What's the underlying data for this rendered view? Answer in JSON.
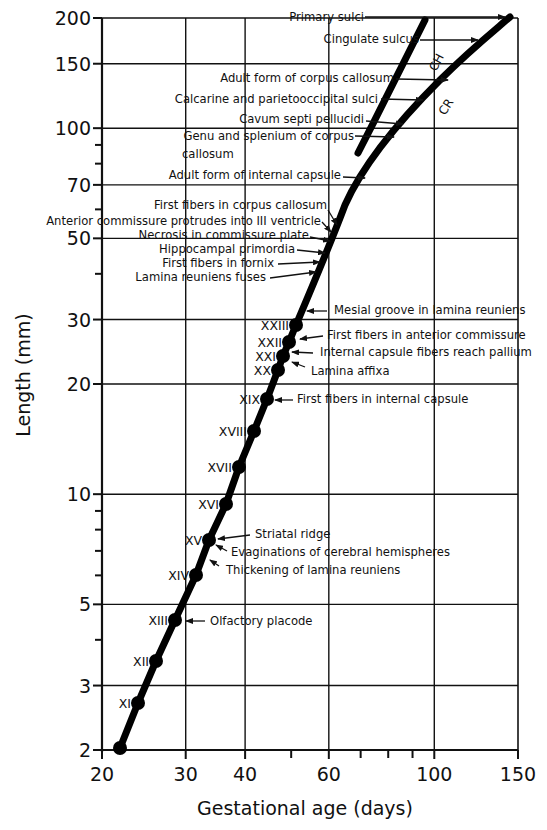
{
  "chart_data": {
    "type": "line",
    "title": "",
    "xlabel": "Gestational age (days)",
    "ylabel": "Length (mm)",
    "xscale": "log",
    "yscale": "log",
    "xlim": [
      20,
      150
    ],
    "ylim": [
      2,
      200
    ],
    "grid": true,
    "x_ticks": [
      20,
      30,
      40,
      60,
      100,
      150
    ],
    "y_ticks": [
      2,
      3,
      5,
      10,
      20,
      30,
      50,
      70,
      100,
      150,
      200
    ],
    "series": [
      {
        "name": "Carnegie stages (crown-rump length)",
        "points": [
          {
            "stage": "",
            "x": 22,
            "y": 2.0
          },
          {
            "stage": "XI",
            "x": 24,
            "y": 2.8
          },
          {
            "stage": "XII",
            "x": 26,
            "y": 3.5
          },
          {
            "stage": "XIII",
            "x": 28,
            "y": 4.5
          },
          {
            "stage": "XIV",
            "x": 31,
            "y": 6
          },
          {
            "stage": "XV",
            "x": 33,
            "y": 7.5
          },
          {
            "stage": "XVI",
            "x": 35,
            "y": 9.5
          },
          {
            "stage": "XVII",
            "x": 38,
            "y": 12
          },
          {
            "stage": "XVIII",
            "x": 41,
            "y": 15
          },
          {
            "stage": "XIX",
            "x": 44,
            "y": 18
          },
          {
            "stage": "XX",
            "x": 46,
            "y": 22
          },
          {
            "stage": "XXI",
            "x": 47,
            "y": 24.5
          },
          {
            "stage": "XXII",
            "x": 48.5,
            "y": 27
          },
          {
            "stage": "XXIII",
            "x": 50,
            "y": 29.5
          }
        ]
      },
      {
        "name": "CR",
        "points": [
          {
            "x": 50,
            "y": 29.5
          },
          {
            "x": 55,
            "y": 40
          },
          {
            "x": 60,
            "y": 52
          },
          {
            "x": 70,
            "y": 75
          },
          {
            "x": 80,
            "y": 95
          },
          {
            "x": 100,
            "y": 125
          },
          {
            "x": 120,
            "y": 155
          },
          {
            "x": 148,
            "y": 200
          }
        ]
      },
      {
        "name": "CH",
        "points": [
          {
            "x": 66,
            "y": 84
          },
          {
            "x": 75,
            "y": 110
          },
          {
            "x": 90,
            "y": 150
          },
          {
            "x": 107,
            "y": 200
          }
        ]
      }
    ],
    "annotations": [
      {
        "text": "Primary sulci",
        "x": 146,
        "y": 200
      },
      {
        "text": "Cingulate sulcus",
        "x": 125,
        "y": 175
      },
      {
        "text": "Adult form of corpus callosum",
        "x": 110,
        "y": 138
      },
      {
        "text": "Calcarine and parietooccipital  sulci",
        "x": 97,
        "y": 121
      },
      {
        "text": "Cavum septi pellucidi",
        "x": 86,
        "y": 106
      },
      {
        "text": "Genu and splenium of corpus callosum",
        "x": 81,
        "y": 98
      },
      {
        "text": "Adult form of internal capsule",
        "x": 70,
        "y": 75
      },
      {
        "text": "First fibers in corpus callosum",
        "x": 60,
        "y": 55
      },
      {
        "text": "Anterior commissure protrudes into III ventricle",
        "x": 59,
        "y": 53
      },
      {
        "text": "Necrosis in commissure plate",
        "x": 58,
        "y": 50
      },
      {
        "text": "Hippocampal primordia",
        "x": 57,
        "y": 47
      },
      {
        "text": "First fibers in fornix",
        "x": 57,
        "y": 44
      },
      {
        "text": "Lamina reuniens fuses",
        "x": 56,
        "y": 41
      },
      {
        "text": "Mesial groove in lamina reuniens",
        "x": 51,
        "y": 31
      },
      {
        "text": "First fibers in anterior commissure",
        "x": 48.5,
        "y": 27
      },
      {
        "text": "Internal capsule fibers reach pallium",
        "x": 47,
        "y": 24.5
      },
      {
        "text": "Lamina affixa",
        "x": 46,
        "y": 22
      },
      {
        "text": "First fibers in internal capsule",
        "x": 44,
        "y": 18
      },
      {
        "text": "Striatal ridge",
        "x": 33,
        "y": 7.5
      },
      {
        "text": "Evaginations of cerebral hemispheres",
        "x": 33,
        "y": 7.2
      },
      {
        "text": "Thickening of lamina reuniens",
        "x": 32,
        "y": 6.8
      },
      {
        "text": "Olfactory placode",
        "x": 28,
        "y": 4.5
      }
    ],
    "curve_labels": [
      "CH",
      "CR"
    ]
  },
  "labels": {
    "xlabel": "Gestational age (days)",
    "ylabel": "Length (mm)",
    "ch": "CH",
    "cr": "CR"
  },
  "plot_px": {
    "left": 102,
    "right": 518,
    "top": 18,
    "bottom": 750
  },
  "y_tick_labels": [
    {
      "v": 200,
      "t": "200"
    },
    {
      "v": 150,
      "t": "150"
    },
    {
      "v": 100,
      "t": "100"
    },
    {
      "v": 70,
      "t": "70"
    },
    {
      "v": 50,
      "t": "50"
    },
    {
      "v": 30,
      "t": "30"
    },
    {
      "v": 20,
      "t": "20"
    },
    {
      "v": 10,
      "t": "10"
    },
    {
      "v": 5,
      "t": "5"
    },
    {
      "v": 3,
      "t": "3"
    },
    {
      "v": 2,
      "t": "2"
    }
  ],
  "y_minor_ticks": [
    90,
    80,
    60,
    40,
    9,
    8,
    7,
    6,
    4
  ],
  "y_grid": [
    150,
    100,
    70,
    50,
    30,
    20,
    10,
    5,
    3
  ],
  "x_tick_labels": [
    {
      "v": 20,
      "t": "20"
    },
    {
      "v": 30,
      "t": "30"
    },
    {
      "v": 40,
      "t": "40"
    },
    {
      "v": 60,
      "t": "60"
    },
    {
      "v": 100,
      "t": "100"
    },
    {
      "v": 150,
      "t": "150"
    }
  ],
  "x_minor_ticks": [
    50,
    70,
    80,
    90
  ],
  "x_grid": [
    30,
    40,
    60,
    100
  ],
  "stage_marks": [
    {
      "px": 120,
      "py": 748,
      "label": ""
    },
    {
      "px": 138,
      "py": 703,
      "label": "XI"
    },
    {
      "px": 156,
      "py": 661,
      "label": "XII"
    },
    {
      "px": 175,
      "py": 620,
      "label": "XIII"
    },
    {
      "px": 196,
      "py": 575,
      "label": "XIV"
    },
    {
      "px": 209,
      "py": 540,
      "label": "XV"
    },
    {
      "px": 226,
      "py": 504,
      "label": "XVI"
    },
    {
      "px": 239,
      "py": 467,
      "label": "XVII"
    },
    {
      "px": 254,
      "py": 431,
      "label": "XVIII"
    },
    {
      "px": 267,
      "py": 399,
      "label": "XIX"
    },
    {
      "px": 278,
      "py": 370,
      "label": "XX"
    },
    {
      "px": 283,
      "py": 356,
      "label": "XXI"
    },
    {
      "px": 289,
      "py": 342,
      "label": "XXII"
    },
    {
      "px": 296,
      "py": 325,
      "label": "XXIII"
    }
  ],
  "annotation_px": [
    {
      "text": "Primary sulci",
      "tx": 364,
      "ty": 21,
      "anchor": "end",
      "line": [
        [
          365,
          17
        ],
        [
          505,
          17
        ]
      ],
      "arrow": true
    },
    {
      "text": "Cingulate sulcus",
      "tx": 419,
      "ty": 43,
      "anchor": "end",
      "line": [
        [
          420,
          40
        ],
        [
          478,
          40
        ]
      ],
      "arrow": true
    },
    {
      "text": "Adult form of corpus callosum",
      "tx": 394,
      "ty": 82,
      "anchor": "end",
      "line": [
        [
          396,
          79
        ],
        [
          448,
          80
        ]
      ],
      "arrow": true
    },
    {
      "text": "Calcarine and parietooccipital  sulci",
      "tx": 378,
      "ty": 103,
      "anchor": "end",
      "line": [
        [
          381,
          99
        ],
        [
          423,
          100
        ]
      ],
      "arrow": true
    },
    {
      "text": "Cavum septi pellucidi",
      "tx": 364,
      "ty": 123,
      "anchor": "end",
      "line": [
        [
          366,
          121
        ],
        [
          403,
          124
        ]
      ],
      "arrow": true
    },
    {
      "text": "Genu and splenium of corpus",
      "tx": 354,
      "ty": 140,
      "anchor": "end",
      "line": [
        [
          355,
          136
        ],
        [
          394,
          137
        ]
      ],
      "arrow": true
    },
    {
      "text": "callosum",
      "tx": 182,
      "ty": 158,
      "anchor": "start",
      "line": null,
      "arrow": false
    },
    {
      "text": "Adult form of internal capsule",
      "tx": 341,
      "ty": 179,
      "anchor": "end",
      "line": [
        [
          343,
          177
        ],
        [
          365,
          178
        ]
      ],
      "arrow": true
    },
    {
      "text": "First fibers in corpus callosum",
      "tx": 327,
      "ty": 209,
      "anchor": "end",
      "line": [
        [
          328,
          210
        ],
        [
          337,
          225
        ]
      ],
      "arrow": true
    },
    {
      "text": "Anterior commissure protrudes into III ventricle",
      "tx": 321,
      "ty": 225,
      "anchor": "end",
      "line": [
        [
          322,
          222
        ],
        [
          331,
          232
        ]
      ],
      "arrow": true
    },
    {
      "text": "Necrosis in commissure plate",
      "tx": 309,
      "ty": 239,
      "anchor": "end",
      "line": [
        [
          310,
          237
        ],
        [
          330,
          241
        ]
      ],
      "arrow": true
    },
    {
      "text": "Hippocampal primordia",
      "tx": 295,
      "ty": 253,
      "anchor": "end",
      "line": [
        [
          297,
          250
        ],
        [
          325,
          253
        ]
      ],
      "arrow": true
    },
    {
      "text": "First fibers in fornix",
      "tx": 274,
      "ty": 267,
      "anchor": "end",
      "line": [
        [
          278,
          264
        ],
        [
          320,
          262
        ]
      ],
      "arrow": true
    },
    {
      "text": "Lamina reuniens fuses",
      "tx": 266,
      "ty": 281,
      "anchor": "end",
      "line": [
        [
          270,
          278
        ],
        [
          316,
          272
        ]
      ],
      "arrow": true
    },
    {
      "text": "Mesial groove in lamina reuniens",
      "tx": 334,
      "ty": 314,
      "anchor": "start",
      "line": [
        [
          327,
          311
        ],
        [
          307,
          311
        ]
      ],
      "arrow": true
    },
    {
      "text": "First fibers in anterior commissure",
      "tx": 327,
      "ty": 339,
      "anchor": "start",
      "line": [
        [
          323,
          336
        ],
        [
          300,
          339
        ]
      ],
      "arrow": true
    },
    {
      "text": "Internal capsule fibers reach pallium",
      "tx": 320,
      "ty": 356,
      "anchor": "start",
      "line": [
        [
          313,
          353
        ],
        [
          292,
          352
        ]
      ],
      "arrow": true
    },
    {
      "text": "Lamina affixa",
      "tx": 311,
      "ty": 375,
      "anchor": "start",
      "line": [
        [
          305,
          367
        ],
        [
          292,
          362
        ]
      ],
      "arrow": true
    },
    {
      "text": "First fibers in internal capsule",
      "tx": 297,
      "ty": 403,
      "anchor": "start",
      "line": [
        [
          293,
          400
        ],
        [
          275,
          400
        ]
      ],
      "arrow": true
    },
    {
      "text": "Striatal ridge",
      "tx": 255,
      "ty": 538,
      "anchor": "start",
      "line": [
        [
          250,
          535
        ],
        [
          218,
          539
        ]
      ],
      "arrow": true
    },
    {
      "text": "Evaginations of cerebral hemispheres",
      "tx": 231,
      "ty": 556,
      "anchor": "start",
      "line": [
        [
          227,
          551
        ],
        [
          216,
          545
        ]
      ],
      "arrow": true
    },
    {
      "text": "Thickening of lamina reuniens",
      "tx": 226,
      "ty": 574,
      "anchor": "start",
      "line": [
        [
          219,
          566
        ],
        [
          210,
          560
        ]
      ],
      "arrow": true
    },
    {
      "text": "Olfactory placode",
      "tx": 210,
      "ty": 625,
      "anchor": "start",
      "line": [
        [
          205,
          621
        ],
        [
          186,
          621
        ]
      ],
      "arrow": true
    }
  ]
}
